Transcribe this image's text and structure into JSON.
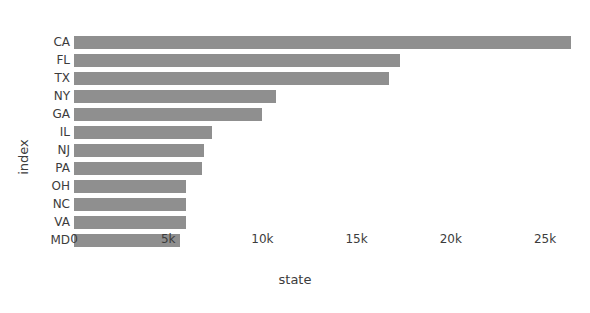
{
  "chart_data": {
    "type": "bar",
    "orientation": "horizontal",
    "title": "",
    "xlabel": "state",
    "ylabel": "index",
    "categories": [
      "CA",
      "FL",
      "TX",
      "NY",
      "GA",
      "IL",
      "NJ",
      "PA",
      "OH",
      "NC",
      "VA",
      "MD"
    ],
    "values": [
      26400,
      17300,
      16700,
      10700,
      10000,
      7300,
      6900,
      6800,
      5950,
      5950,
      5950,
      5600
    ],
    "xticks": [
      0,
      5000,
      10000,
      15000,
      20000,
      25000
    ],
    "xtick_labels": [
      "0",
      "5k",
      "10k",
      "15k",
      "20k",
      "25k"
    ],
    "xlim": [
      0,
      26400
    ],
    "axis_max": 26400,
    "grid": false,
    "legend": null,
    "bar_color": "#8f8f8f",
    "background_color": "#ffffff",
    "text_color": "#3c3c3c"
  }
}
